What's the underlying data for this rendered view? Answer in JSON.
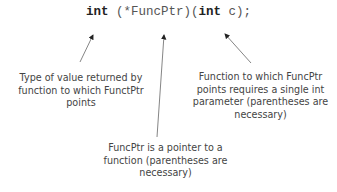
{
  "code": {
    "return_type": "int",
    "declarator": " (*FuncPtr)(",
    "param_type": "int",
    "param_rest": " c);"
  },
  "annotations": {
    "return_type": "Type of value returned by function to which FunctPtr points",
    "parameter": "Function to which FuncPtr points requires a single int parameter (parentheses are necessary)",
    "pointer": "FuncPtr is a pointer  to a function (parentheses are necessary)"
  },
  "colors": {
    "arrow": "#666666",
    "keyword": "#222222",
    "text": "#444444"
  }
}
